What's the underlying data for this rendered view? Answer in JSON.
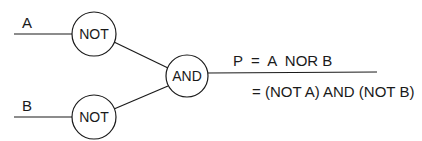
{
  "diagram": {
    "inputs": [
      {
        "label": "A"
      },
      {
        "label": "B"
      }
    ],
    "gates": [
      {
        "id": "not_a",
        "label": "NOT"
      },
      {
        "id": "not_b",
        "label": "NOT"
      },
      {
        "id": "and",
        "label": "AND"
      }
    ],
    "output": {
      "line1": "P  =  A  NOR B",
      "line2": "= (NOT A) AND (NOT B)"
    }
  }
}
